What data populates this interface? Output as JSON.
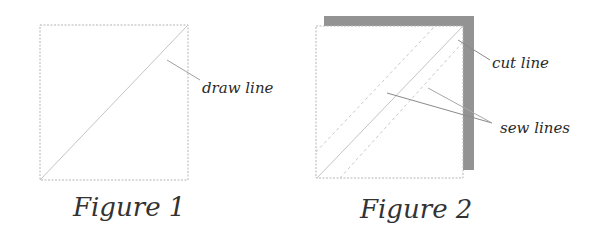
{
  "figures": [
    {
      "id": "figure-1",
      "caption": "Figure 1",
      "square": {
        "x": 40,
        "y": 25,
        "size": 148,
        "border_style": "dashed"
      },
      "lines": [
        {
          "name": "draw-line",
          "style": "solid",
          "from": [
            40,
            180
          ],
          "to": [
            188,
            25
          ]
        }
      ],
      "callouts": [
        {
          "label": "draw line",
          "text_pos": [
            202,
            93
          ],
          "leaders": [
            {
              "from": [
                167,
                60
              ],
              "to": [
                200,
                80
              ]
            }
          ]
        }
      ]
    },
    {
      "id": "figure-2",
      "caption": "Figure 2",
      "back_square": {
        "x": 324,
        "y": 16,
        "width": 150,
        "height": 154,
        "color": "#939393"
      },
      "front_square": {
        "x": 316,
        "y": 26,
        "width": 147,
        "height": 152,
        "border_style": "dashed"
      },
      "lines": [
        {
          "name": "cut-line",
          "style": "solid",
          "from": [
            317,
            178
          ],
          "to": [
            463,
            26
          ]
        },
        {
          "name": "sew-line-upper",
          "style": "dashed",
          "from": [
            316,
            152
          ],
          "to": [
            435,
            26
          ]
        },
        {
          "name": "sew-line-lower",
          "style": "dashed",
          "from": [
            340,
            178
          ],
          "to": [
            463,
            42
          ]
        }
      ],
      "callouts": [
        {
          "label": "cut line",
          "text_pos": [
            492,
            68
          ],
          "leaders": [
            {
              "from": [
                458,
                40
              ],
              "to": [
                490,
                60
              ]
            }
          ]
        },
        {
          "label": "sew lines",
          "text_pos": [
            500,
            133
          ],
          "leaders": [
            {
              "from": [
                387,
                93
              ],
              "to": [
                492,
                123
              ]
            },
            {
              "from": [
                428,
                88
              ],
              "to": [
                492,
                123
              ]
            }
          ]
        }
      ]
    }
  ],
  "colors": {
    "background": "#ffffff",
    "square_border": "#b5b5b5",
    "draw_line": "#c4c4c4",
    "leader_line": "#8a8a8a",
    "fabric_back": "#939393",
    "text": "#2a2a2a"
  }
}
